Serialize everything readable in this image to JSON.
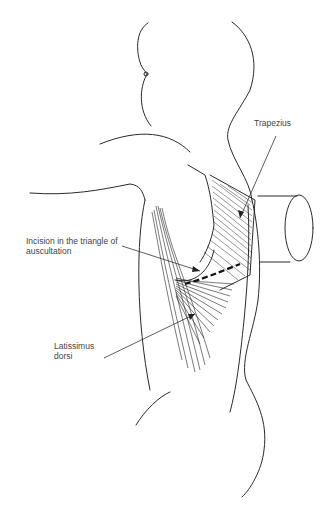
{
  "figure": {
    "type": "anatomical line drawing",
    "colors": {
      "line": "#2a2a2a",
      "label": "#444444",
      "background": "#ffffff"
    }
  },
  "labels": {
    "trapezius": "Trapezius",
    "incision_line1": "Incision in the triangle of",
    "incision_line2": "auscultation",
    "latissimus_line1": "Latissimus",
    "latissimus_line2": "dorsi"
  }
}
